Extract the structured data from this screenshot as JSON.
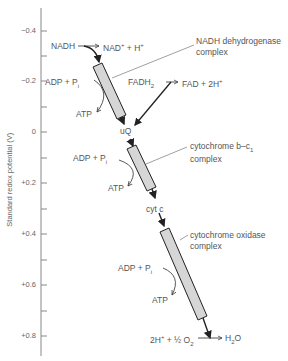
{
  "axis": {
    "label": "Standard redox potential (V)",
    "ticks": [
      "−0.4",
      "−0.2",
      "0",
      "+0.2",
      "+0.4",
      "+0.6",
      "+0.8"
    ]
  },
  "complexes": {
    "nadh_dehydrogenase": {
      "line1": "NADH dehydrogenase",
      "line2": "complex"
    },
    "cytochrome_bc1": {
      "line1": "cytochrome b–c",
      "sub": "1",
      "line2": "complex"
    },
    "cytochrome_oxidase": {
      "line1": "cytochrome oxidase",
      "line2": "complex"
    }
  },
  "species": {
    "nadh": "NADH",
    "nad_plus": "NAD",
    "nad_plus_rest": " + H",
    "fadh2": "FADH",
    "fad": "FAD + 2H",
    "uq": "uQ",
    "cyt_c": "cyt c",
    "o2_left": "2H",
    "o2_mid": " + ½ O",
    "h2o": "H",
    "h2o_rest": "O"
  },
  "atp_sites": [
    {
      "adp": "ADP + P",
      "sub": "i",
      "atp": "ATP"
    },
    {
      "adp": "ADP + P",
      "sub": "i",
      "atp": "ATP"
    },
    {
      "adp": "ADP + P",
      "sub": "i",
      "atp": "ATP"
    }
  ]
}
